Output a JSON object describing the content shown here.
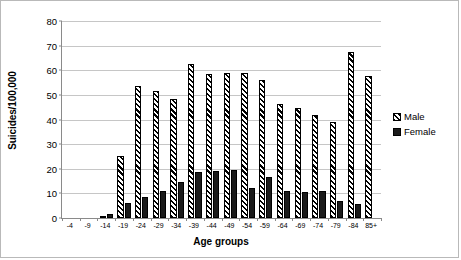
{
  "chart_data": {
    "type": "bar",
    "title": "",
    "xlabel": "Age groups",
    "ylabel": "Suicides/100,000",
    "ylim": [
      0,
      80
    ],
    "ytick_step": 10,
    "yticks": [
      0,
      10,
      20,
      30,
      40,
      50,
      60,
      70,
      80
    ],
    "grid": true,
    "legend_position": "right",
    "categories": [
      "-4",
      "-9",
      "-14",
      "-19",
      "-24",
      "-29",
      "-34",
      "-39",
      "-44",
      "-49",
      "-54",
      "-59",
      "-64",
      "-69",
      "-74",
      "-79",
      "-84",
      "85+"
    ],
    "series": [
      {
        "name": "Male",
        "pattern": "diagonal-hatch",
        "color": "#000000",
        "values": [
          0,
          0,
          1.0,
          25.0,
          53.5,
          51.5,
          48.5,
          62.5,
          58.5,
          59.0,
          59.0,
          56.0,
          46.5,
          44.5,
          42.0,
          39.0,
          67.5,
          57.5
        ]
      },
      {
        "name": "Female",
        "pattern": "solid",
        "color": "#1a1a1a",
        "values": [
          0,
          0,
          1.5,
          6.0,
          8.5,
          11.0,
          14.5,
          18.5,
          19.0,
          19.5,
          12.0,
          16.5,
          11.0,
          10.5,
          11.0,
          7.0,
          5.5,
          0
        ]
      }
    ]
  },
  "legend": {
    "items": [
      {
        "label": "Male",
        "swatch": "hatched-swatch"
      },
      {
        "label": "Female",
        "swatch": "solid-swatch"
      }
    ]
  }
}
